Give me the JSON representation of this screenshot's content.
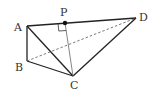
{
  "diagram": {
    "type": "tetrahedron",
    "points": {
      "A": {
        "label": "A",
        "x": 27,
        "y": 26
      },
      "B": {
        "label": "B",
        "x": 27,
        "y": 61
      },
      "C": {
        "label": "C",
        "x": 73,
        "y": 76
      },
      "D": {
        "label": "D",
        "x": 136,
        "y": 18
      },
      "P": {
        "label": "P",
        "x": 65,
        "y": 23
      }
    },
    "solid_edges": [
      "AB",
      "AC",
      "AD",
      "BC",
      "CD"
    ],
    "dashed_edges": [
      "BD"
    ],
    "thin_segments": [
      "PC"
    ],
    "right_angle_at": "P",
    "colors": {
      "line": "#222222",
      "dashed": "#555555",
      "thin": "#666666",
      "text": "#333333"
    }
  }
}
